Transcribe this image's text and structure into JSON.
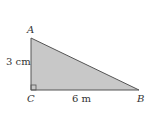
{
  "figure": {
    "vertices": [
      {
        "name": "A",
        "x": 31,
        "y": 38
      },
      {
        "name": "B",
        "x": 139,
        "y": 90
      },
      {
        "name": "C",
        "x": 31,
        "y": 90
      }
    ],
    "labels": {
      "a": "A",
      "b": "B",
      "c": "C",
      "side_ac": "3 cm",
      "side_cb": "6 m"
    },
    "colors": {
      "fill": "#c8c8c8",
      "stroke": "#555555"
    },
    "right_angle_at": "C"
  }
}
